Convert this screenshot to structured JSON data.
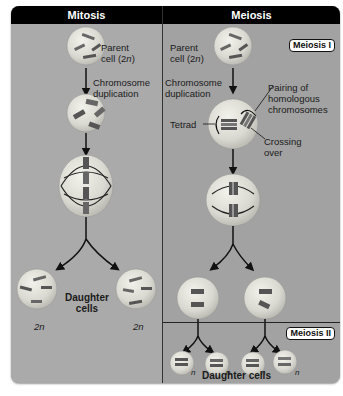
{
  "mitosis": {
    "title": "Mitosis",
    "parent_label_line1": "Parent",
    "parent_label_line2": "cell (2",
    "parent_label_n": "n",
    "parent_label_close": ")",
    "duplication_line1": "Chromosome",
    "duplication_line2": "duplication",
    "daughter_line1": "Daughter",
    "daughter_line2": "cells",
    "ploidy_left": "2n",
    "ploidy_right": "2n"
  },
  "meiosis": {
    "title": "Meiosis",
    "stage1_badge": "Meiosis I",
    "stage2_badge": "Meiosis II",
    "parent_label_line1": "Parent",
    "parent_label_line2": "cell (2",
    "parent_label_n": "n",
    "parent_label_close": ")",
    "duplication_line1": "Chromosome",
    "duplication_line2": "duplication",
    "pairing_line1": "Pairing of",
    "pairing_line2": "homologous",
    "pairing_line3": "chromosomes",
    "tetrad": "Tetrad",
    "crossing_line1": "Crossing",
    "crossing_line2": "over",
    "daughter_cells": "Daughter cells",
    "ploidy": [
      "n",
      "n",
      "n",
      "n"
    ]
  },
  "colors": {
    "header_bg": "#000000",
    "panel_left": "#aaaaaa",
    "panel_right": "#a2a2a2",
    "cell_fill": "#dcdcd4",
    "chromosome": "#555555"
  }
}
